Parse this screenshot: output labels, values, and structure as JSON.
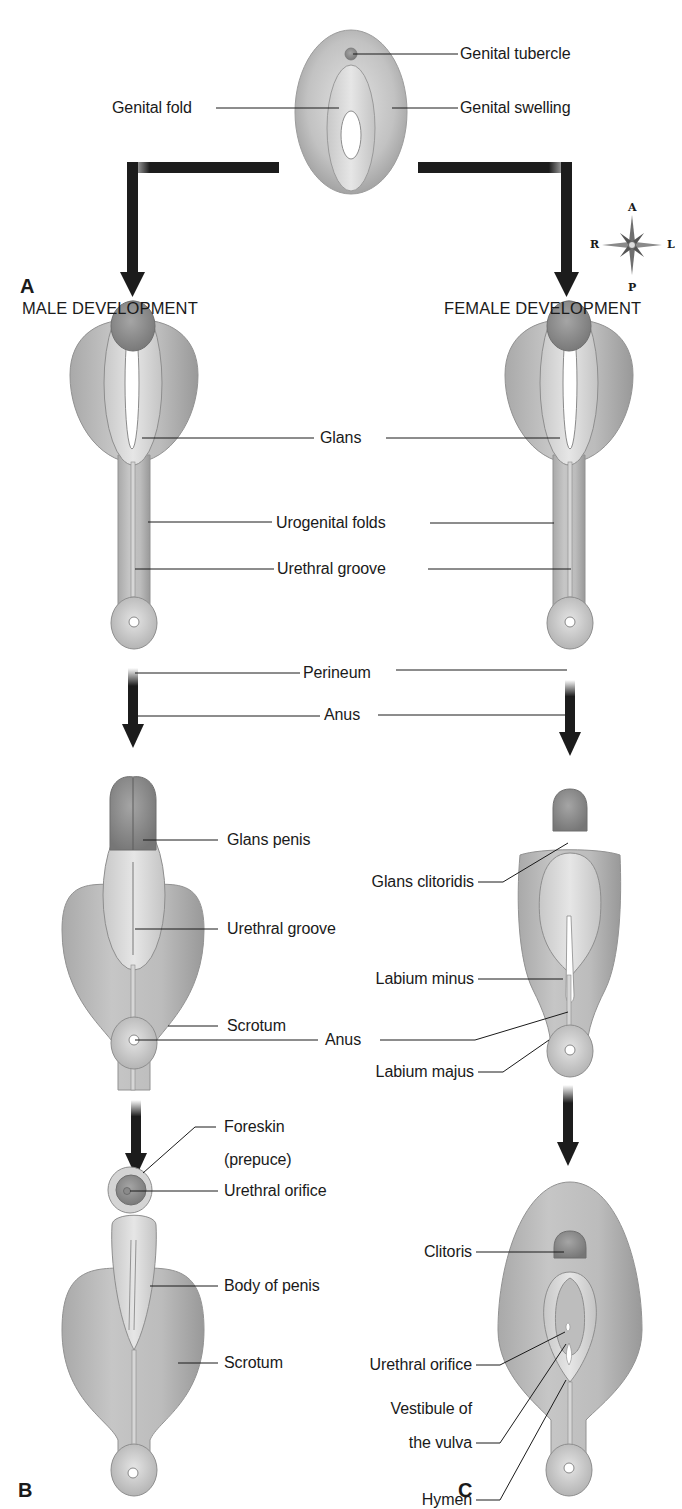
{
  "figure": {
    "panels": {
      "a": "A",
      "b": "B",
      "c": "C"
    },
    "headers": {
      "male": "MALE DEVELOPMENT",
      "female": "FEMALE DEVELOPMENT"
    },
    "compass": {
      "top": "A",
      "bottom": "P",
      "left": "R",
      "right": "L"
    },
    "colors": {
      "tissue_light": "#d9d9d9",
      "tissue_mid": "#b4b4b4",
      "tissue_dark": "#8f8f8f",
      "glans": "#8a8a8a",
      "arrow": "#1c1c1c",
      "leader_line": "#1a1a1a",
      "background": "#ffffff"
    },
    "indifferent_stage": {
      "labels": {
        "genital_tubercle": "Genital tubercle",
        "genital_fold": "Genital fold",
        "genital_swelling": "Genital swelling"
      }
    },
    "early_stage_shared": {
      "labels": {
        "glans": "Glans",
        "urogenital_folds": "Urogenital folds",
        "urethral_groove": "Urethral groove",
        "perineum": "Perineum",
        "anus": "Anus"
      }
    },
    "male_mid": {
      "labels": {
        "glans_penis": "Glans penis",
        "urethral_groove": "Urethral groove",
        "scrotum": "Scrotum"
      }
    },
    "female_mid": {
      "labels": {
        "glans_clitoridis": "Glans clitoridis",
        "labium_minus": "Labium minus",
        "labium_majus": "Labium majus"
      }
    },
    "mid_shared": {
      "labels": {
        "anus": "Anus"
      }
    },
    "male_final": {
      "labels": {
        "foreskin_line1": "Foreskin",
        "foreskin_line2": "(prepuce)",
        "urethral_orifice": "Urethral orifice",
        "body_of_penis": "Body of penis",
        "scrotum": "Scrotum"
      }
    },
    "female_final": {
      "labels": {
        "clitoris": "Clitoris",
        "urethral_orifice": "Urethral orifice",
        "vestibule_line1": "Vestibule of",
        "vestibule_line2": "the vulva",
        "hymen": "Hymen"
      }
    }
  }
}
